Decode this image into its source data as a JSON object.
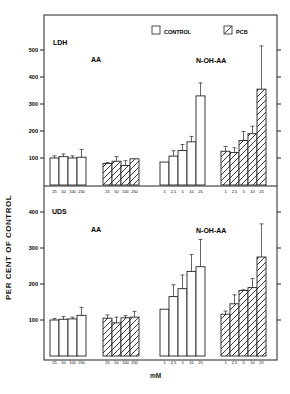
{
  "chart_data": [
    {
      "type": "bar",
      "panel": "LDH",
      "ylabel": "PER CENT OF CONTROL",
      "xlabel": "mM",
      "yticks": [
        100,
        200,
        300,
        400,
        500
      ],
      "ylim": [
        0,
        560
      ],
      "legend": [
        "CONTROL",
        "PCB"
      ],
      "groups": [
        {
          "label": "AA",
          "series": "CONTROL",
          "categories": [
            "25",
            "50",
            "100",
            "250"
          ],
          "values": [
            100,
            105,
            100,
            103
          ],
          "err_top": [
            108,
            115,
            108,
            132
          ]
        },
        {
          "label": "AA",
          "series": "PCB",
          "categories": [
            "25",
            "50",
            "100",
            "250"
          ],
          "values": [
            80,
            88,
            72,
            97
          ],
          "err_top": [
            83,
            105,
            90,
            97
          ]
        },
        {
          "label": "N-OH-AA",
          "series": "CONTROL",
          "categories": [
            "1",
            "2.5",
            "5",
            "10",
            "25"
          ],
          "values": [
            85,
            107,
            128,
            160,
            330
          ],
          "err_top": [
            85,
            127,
            150,
            180,
            378
          ]
        },
        {
          "label": "N-OH-AA",
          "series": "PCB",
          "categories": [
            "1",
            "2.5",
            "5",
            "10",
            "25"
          ],
          "values": [
            125,
            120,
            165,
            190,
            355
          ],
          "err_top": [
            143,
            138,
            198,
            218,
            515
          ]
        }
      ]
    },
    {
      "type": "bar",
      "panel": "UDS",
      "ylabel": "PER CENT OF CONTROL",
      "xlabel": "mM",
      "yticks": [
        100,
        200,
        300,
        400
      ],
      "ylim": [
        0,
        420
      ],
      "legend": [
        "CONTROL",
        "PCB"
      ],
      "groups": [
        {
          "label": "AA",
          "series": "CONTROL",
          "categories": [
            "25",
            "50",
            "100",
            "250"
          ],
          "values": [
            100,
            102,
            103,
            113
          ],
          "err_top": [
            104,
            110,
            108,
            135
          ]
        },
        {
          "label": "AA",
          "series": "PCB",
          "categories": [
            "25",
            "50",
            "100",
            "250"
          ],
          "values": [
            105,
            92,
            106,
            108
          ],
          "err_top": [
            114,
            108,
            112,
            124
          ]
        },
        {
          "label": "N-OH-AA",
          "series": "CONTROL",
          "categories": [
            "1",
            "2.5",
            "5",
            "10",
            "25"
          ],
          "values": [
            130,
            165,
            187,
            235,
            248
          ],
          "err_top": [
            130,
            198,
            225,
            282,
            324
          ]
        },
        {
          "label": "N-OH-AA",
          "series": "PCB",
          "categories": [
            "1",
            "2.5",
            "5",
            "10",
            "25"
          ],
          "values": [
            116,
            145,
            182,
            190,
            275
          ],
          "err_top": [
            125,
            170,
            184,
            215,
            367
          ]
        }
      ]
    }
  ],
  "labels": {
    "ylabel": "PER CENT OF CONTROL",
    "xlabel": "mM",
    "legend_control": "CONTROL",
    "legend_pcb": "PCB",
    "panel_top": "LDH",
    "panel_bottom": "UDS",
    "group_aa": "AA",
    "group_nohaa": "N-OH-AA"
  }
}
